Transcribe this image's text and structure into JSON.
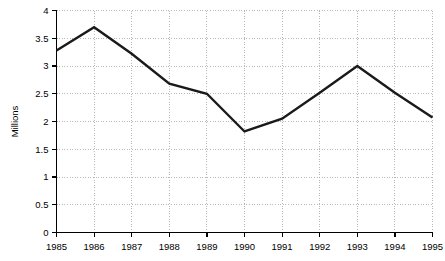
{
  "chart_data": {
    "type": "line",
    "title": "",
    "xlabel": "",
    "ylabel": "Millions",
    "categories": [
      "1985",
      "1986",
      "1987",
      "1988",
      "1989",
      "1990",
      "1991",
      "1992",
      "1993",
      "1994",
      "1995"
    ],
    "values": [
      3.28,
      3.7,
      3.22,
      2.68,
      2.5,
      1.82,
      2.05,
      2.52,
      3.0,
      2.52,
      2.07
    ],
    "series": [
      {
        "name": "Millions",
        "values": [
          3.28,
          3.7,
          3.22,
          2.68,
          2.5,
          1.82,
          2.05,
          2.52,
          3.0,
          2.52,
          2.07
        ]
      }
    ],
    "ylim": [
      0,
      4
    ],
    "ytick_values": [
      0,
      0.5,
      1,
      1.5,
      2,
      2.5,
      3,
      3.5,
      4
    ],
    "ytick_labels": [
      "0",
      "0.5",
      "1",
      "1.5",
      "2",
      "2.5",
      "3",
      "3.5",
      "4"
    ],
    "xtick_labels": [
      "1985",
      "1986",
      "1987",
      "1988",
      "1989",
      "1990",
      "1991",
      "1992",
      "1993",
      "1994",
      "1995"
    ],
    "grid": true,
    "grid_style": "dotted",
    "legend": false,
    "legend_position": "none",
    "line_color": "#1a1a1a",
    "grid_color": "#9a9a9a",
    "axis_color": "#000000",
    "background_color": "#ffffff"
  },
  "axis": {
    "y_title": "Millions"
  }
}
